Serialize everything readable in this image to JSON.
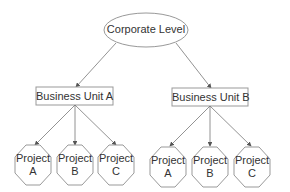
{
  "diagram": {
    "root": {
      "label": "Corporate Level"
    },
    "units": [
      {
        "label": "Business Unit A",
        "projects": [
          {
            "line1": "Project",
            "line2": "A"
          },
          {
            "line1": "Project",
            "line2": "B"
          },
          {
            "line1": "Project",
            "line2": "C"
          }
        ]
      },
      {
        "label": "Business Unit B",
        "projects": [
          {
            "line1": "Project",
            "line2": "A"
          },
          {
            "line1": "Project",
            "line2": "B"
          },
          {
            "line1": "Project",
            "line2": "C"
          }
        ]
      }
    ],
    "colors": {
      "stroke": "#999999",
      "arrow": "#555555",
      "text": "#333333",
      "background": "#ffffff"
    }
  }
}
